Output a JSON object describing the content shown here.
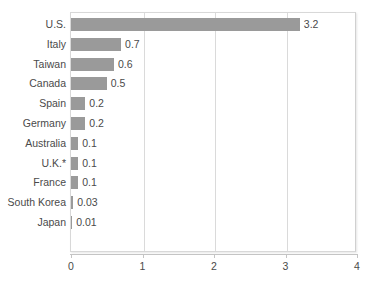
{
  "chart_data": {
    "type": "bar",
    "orientation": "horizontal",
    "title": "",
    "subtitle": "",
    "xlabel": "",
    "ylabel": "",
    "xlim": [
      0,
      4
    ],
    "xticks": [
      0,
      1,
      2,
      3,
      4
    ],
    "xtick_labels": [
      "0",
      "1",
      "2",
      "3",
      "4"
    ],
    "grid": true,
    "gridlines_at": [
      1,
      2,
      3
    ],
    "legend": null,
    "categories": [
      "U.S.",
      "Italy",
      "Taiwan",
      "Canada",
      "Spain",
      "Germany",
      "Australia",
      "U.K.*",
      "France",
      "South Korea",
      "Japan"
    ],
    "values": [
      3.2,
      0.7,
      0.6,
      0.5,
      0.2,
      0.2,
      0.1,
      0.1,
      0.1,
      0.03,
      0.01
    ],
    "value_labels": [
      "3.2",
      "0.7",
      "0.6",
      "0.5",
      "0.2",
      "0.2",
      "0.1",
      "0.1",
      "0.1",
      "0.03",
      "0.01"
    ],
    "bar_color": "#9a9a9a",
    "text_color": "#4a4a4a",
    "grid_color": "#dadada",
    "background_color": "#ffffff",
    "annotations": []
  }
}
